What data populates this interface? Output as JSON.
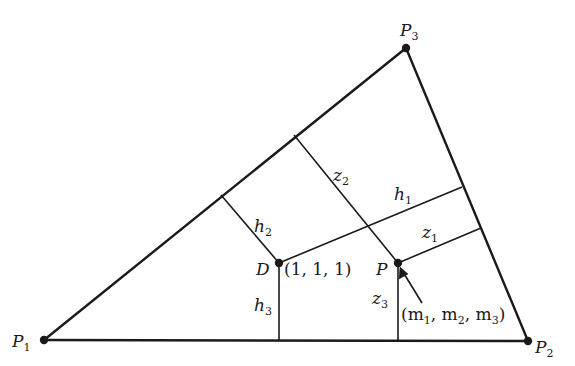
{
  "diagram": {
    "type": "triangle-distance-diagram",
    "colors": {
      "line": "#1a1a1a",
      "background": "#ffffff"
    },
    "vertices": [
      {
        "id": "P1",
        "label": "P",
        "sub": "1",
        "x": 44,
        "y": 340
      },
      {
        "id": "P2",
        "label": "P",
        "sub": "2",
        "x": 528,
        "y": 341
      },
      {
        "id": "P3",
        "label": "P",
        "sub": "3",
        "x": 406,
        "y": 48
      }
    ],
    "points": {
      "D": {
        "label": "D",
        "coords_label": "(1, 1, 1)",
        "x": 279,
        "y": 263
      },
      "P": {
        "label": "P",
        "coords_label_parts": [
          "(m",
          "1",
          ", m",
          "2",
          ", m",
          "3",
          ")"
        ],
        "x": 398,
        "y": 263
      }
    },
    "segments": {
      "h1": {
        "label": "h",
        "sub": "1"
      },
      "h2": {
        "label": "h",
        "sub": "2"
      },
      "h3": {
        "label": "h",
        "sub": "3"
      },
      "z1": {
        "label": "z",
        "sub": "1"
      },
      "z2": {
        "label": "z",
        "sub": "2"
      },
      "z3": {
        "label": "z",
        "sub": "3"
      }
    }
  }
}
